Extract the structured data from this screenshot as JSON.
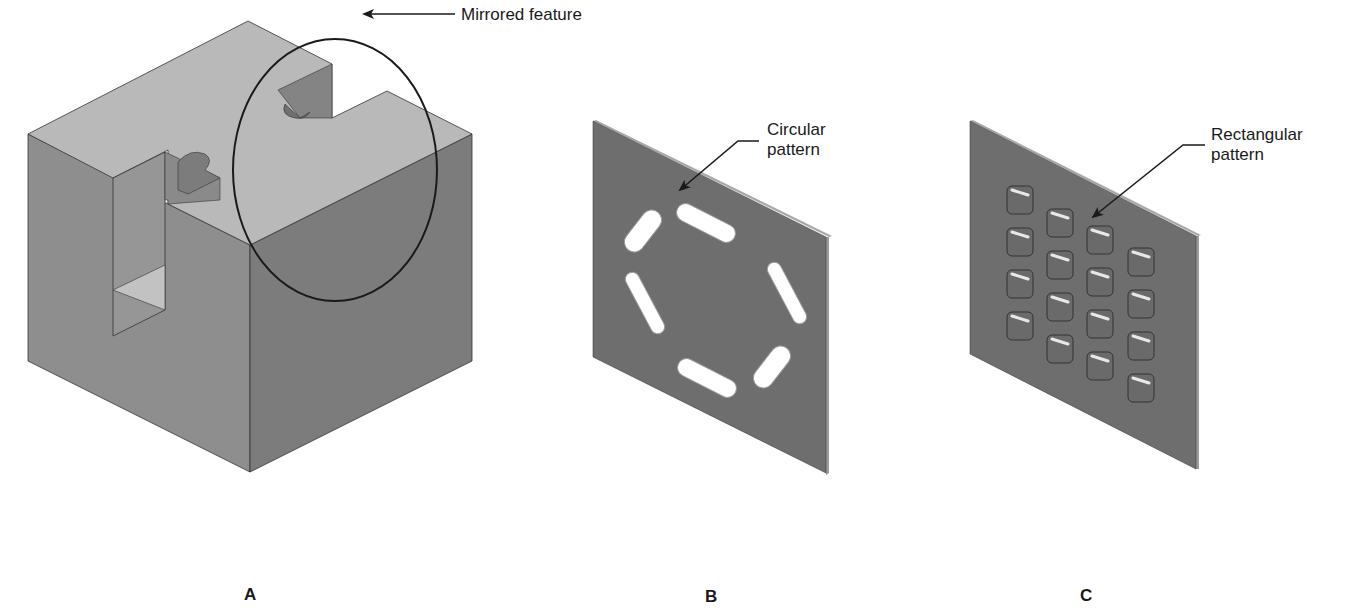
{
  "figure": {
    "panels": [
      {
        "id": "A",
        "caption": "A",
        "subject": "isometric-block-with-slots",
        "callout": {
          "text": "Mirrored feature"
        }
      },
      {
        "id": "B",
        "caption": "B",
        "subject": "plate-with-slotted-holes",
        "callout": {
          "line1": "Circular",
          "line2": "pattern"
        },
        "pattern_count": 6
      },
      {
        "id": "C",
        "caption": "C",
        "subject": "plate-with-raised-bosses",
        "callout": {
          "line1": "Rectangular",
          "line2": "pattern"
        },
        "pattern_rows": 4,
        "pattern_cols": 4
      }
    ],
    "colors": {
      "top_face": "#b9b9b9",
      "left_face": "#8e8e8e",
      "right_face": "#7c7c7c",
      "plate_face": "#6e6e6e",
      "plate_edge": "#a8a8a8",
      "hole_fill": "#ffffff",
      "line": "#1a1a1a"
    }
  }
}
